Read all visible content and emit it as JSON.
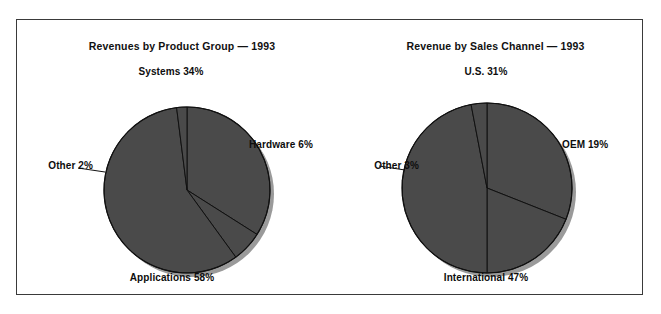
{
  "page": {
    "clipped_header_text": "",
    "background": "#ffffff",
    "frame_color": "#3a3a3a"
  },
  "style": {
    "slice_fill": "#4a4a4a",
    "slice_stroke": "#111111",
    "shadow_fill": "#9a9a9a",
    "label_color": "#0d0d0d"
  },
  "chart_data": [
    {
      "type": "pie",
      "id": "revenues-by-product-group",
      "title": "Revenues by Product Group — 1993",
      "xlabel": "",
      "ylabel": "",
      "legend": "none",
      "grid": false,
      "unit": "percent",
      "categories": [
        "Systems",
        "Hardware",
        "Applications",
        "Other"
      ],
      "values": [
        34,
        6,
        58,
        2
      ],
      "labels": [
        "Systems 34%",
        "Hardware 6%",
        "Applications 58%",
        "Other 2%"
      ],
      "slices": [
        {
          "name": "Systems",
          "value": 34,
          "label": "Systems 34%",
          "label_position": "top"
        },
        {
          "name": "Hardware",
          "value": 6,
          "label": "Hardware 6%",
          "label_position": "right"
        },
        {
          "name": "Applications",
          "value": 58,
          "label": "Applications 58%",
          "label_position": "bottom"
        },
        {
          "name": "Other",
          "value": 2,
          "label": "Other 2%",
          "label_position": "left"
        }
      ]
    },
    {
      "type": "pie",
      "id": "revenue-by-sales-channel",
      "title": "Revenue by Sales Channel — 1993",
      "xlabel": "",
      "ylabel": "",
      "legend": "none",
      "grid": false,
      "unit": "percent",
      "categories": [
        "U.S.",
        "OEM",
        "International",
        "Other"
      ],
      "values": [
        31,
        19,
        47,
        3
      ],
      "labels": [
        "U.S. 31%",
        "OEM 19%",
        "International 47%",
        "Other 3%"
      ],
      "slices": [
        {
          "name": "U.S.",
          "value": 31,
          "label": "U.S. 31%",
          "label_position": "top"
        },
        {
          "name": "OEM",
          "value": 19,
          "label": "OEM 19%",
          "label_position": "right"
        },
        {
          "name": "International",
          "value": 47,
          "label": "International 47%",
          "label_position": "bottom"
        },
        {
          "name": "Other",
          "value": 3,
          "label": "Other 3%",
          "label_position": "left"
        }
      ]
    }
  ]
}
